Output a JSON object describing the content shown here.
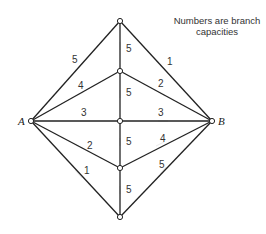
{
  "note": {
    "line1": "Numbers are branch",
    "line2": "capacities"
  },
  "nodes": {
    "A": "A",
    "B": "B"
  },
  "edges": [
    {
      "from": "A",
      "to": "top",
      "capacity": "5"
    },
    {
      "from": "A",
      "to": "n2",
      "capacity": "4"
    },
    {
      "from": "A",
      "to": "center",
      "capacity": "3"
    },
    {
      "from": "A",
      "to": "n4",
      "capacity": "2"
    },
    {
      "from": "A",
      "to": "bottom",
      "capacity": "1"
    },
    {
      "from": "top",
      "to": "n2",
      "capacity": "5"
    },
    {
      "from": "n2",
      "to": "center",
      "capacity": "5"
    },
    {
      "from": "center",
      "to": "n4",
      "capacity": "5"
    },
    {
      "from": "n4",
      "to": "bottom",
      "capacity": "5"
    },
    {
      "from": "top",
      "to": "B",
      "capacity": "1"
    },
    {
      "from": "n2",
      "to": "B",
      "capacity": "2"
    },
    {
      "from": "center",
      "to": "B",
      "capacity": "3"
    },
    {
      "from": "n4",
      "to": "B",
      "capacity": "4"
    },
    {
      "from": "bottom",
      "to": "B",
      "capacity": "5"
    }
  ]
}
